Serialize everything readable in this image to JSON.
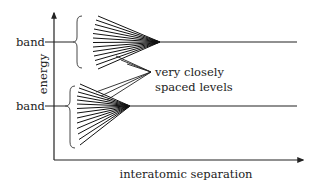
{
  "diagram": {
    "axes": {
      "y_label": "energy",
      "x_label": "interatomic separation"
    },
    "bands": [
      {
        "label": "band",
        "level_y": 42,
        "converge_x": 160,
        "line_count": 13
      },
      {
        "label": "band",
        "level_y": 106,
        "converge_x": 130,
        "line_count": 13
      }
    ],
    "annotation": {
      "line1": "very closely",
      "line2": "spaced levels"
    },
    "colors": {
      "ink": "#222222",
      "background": "#ffffff"
    }
  }
}
